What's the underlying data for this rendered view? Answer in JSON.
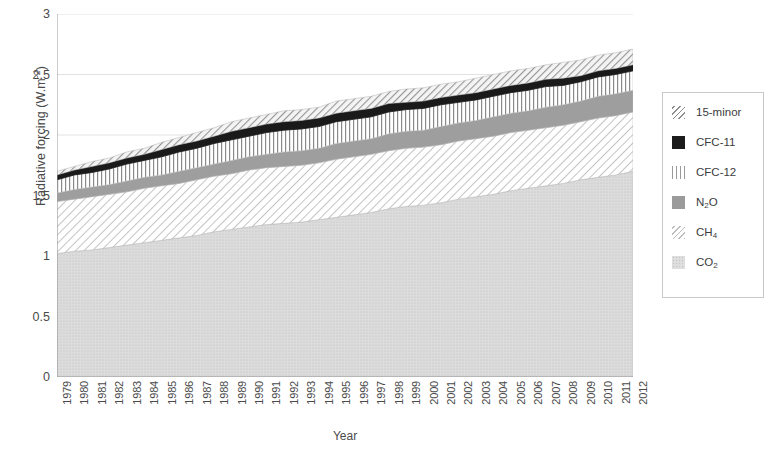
{
  "chart_data": {
    "type": "area",
    "title": "",
    "xlabel": "Year",
    "ylabel": "Radiative forcing (W.m⁻²)",
    "ylabel_html": "Radiative forcing (W.m<sup>-2</sup>)",
    "ylim": [
      0,
      3
    ],
    "ytick_labels": [
      "0",
      "0.5",
      "1",
      "1.5",
      "2",
      "2.5",
      "3"
    ],
    "ytick_values": [
      0,
      0.5,
      1,
      1.5,
      2,
      2.5,
      3
    ],
    "grid": true,
    "legend_position": "right",
    "stacked": true,
    "stack_order_bottom_to_top": [
      "CO2",
      "CH4",
      "N2O",
      "CFC-12",
      "CFC-11",
      "15-minor"
    ],
    "categories": [
      "1979",
      "1980",
      "1981",
      "1982",
      "1983",
      "1984",
      "1985",
      "1986",
      "1987",
      "1988",
      "1989",
      "1990",
      "1991",
      "1992",
      "1993",
      "1994",
      "1995",
      "1996",
      "1997",
      "1998",
      "1999",
      "2000",
      "2001",
      "2002",
      "2003",
      "2004",
      "2005",
      "2006",
      "2007",
      "2008",
      "2009",
      "2010",
      "2011",
      "2012"
    ],
    "series": [
      {
        "name": "CO2",
        "values": [
          1.02,
          1.04,
          1.05,
          1.07,
          1.09,
          1.11,
          1.13,
          1.15,
          1.17,
          1.2,
          1.22,
          1.24,
          1.26,
          1.27,
          1.28,
          1.3,
          1.32,
          1.34,
          1.36,
          1.39,
          1.41,
          1.42,
          1.44,
          1.47,
          1.49,
          1.51,
          1.54,
          1.56,
          1.58,
          1.6,
          1.63,
          1.65,
          1.67,
          1.7
        ]
      },
      {
        "name": "CH4",
        "values": [
          0.43,
          0.43,
          0.44,
          0.44,
          0.44,
          0.45,
          0.45,
          0.45,
          0.46,
          0.46,
          0.46,
          0.47,
          0.47,
          0.47,
          0.47,
          0.47,
          0.48,
          0.48,
          0.48,
          0.48,
          0.48,
          0.48,
          0.48,
          0.48,
          0.48,
          0.48,
          0.48,
          0.48,
          0.48,
          0.48,
          0.48,
          0.49,
          0.49,
          0.49
        ]
      },
      {
        "name": "N2O",
        "values": [
          0.07,
          0.08,
          0.08,
          0.08,
          0.09,
          0.09,
          0.09,
          0.1,
          0.1,
          0.1,
          0.11,
          0.11,
          0.11,
          0.12,
          0.12,
          0.12,
          0.13,
          0.13,
          0.13,
          0.14,
          0.14,
          0.14,
          0.15,
          0.15,
          0.15,
          0.16,
          0.16,
          0.16,
          0.17,
          0.17,
          0.17,
          0.18,
          0.18,
          0.18
        ]
      },
      {
        "name": "CFC-12",
        "values": [
          0.11,
          0.12,
          0.12,
          0.13,
          0.14,
          0.14,
          0.15,
          0.16,
          0.16,
          0.17,
          0.17,
          0.17,
          0.18,
          0.18,
          0.18,
          0.18,
          0.18,
          0.18,
          0.18,
          0.18,
          0.18,
          0.18,
          0.18,
          0.17,
          0.17,
          0.17,
          0.17,
          0.17,
          0.17,
          0.16,
          0.16,
          0.16,
          0.16,
          0.16
        ]
      },
      {
        "name": "CFC-11",
        "values": [
          0.04,
          0.04,
          0.05,
          0.05,
          0.05,
          0.05,
          0.06,
          0.06,
          0.06,
          0.06,
          0.07,
          0.07,
          0.07,
          0.07,
          0.07,
          0.07,
          0.07,
          0.07,
          0.07,
          0.07,
          0.06,
          0.06,
          0.06,
          0.06,
          0.06,
          0.06,
          0.06,
          0.06,
          0.06,
          0.06,
          0.05,
          0.05,
          0.05,
          0.05
        ]
      },
      {
        "name": "15-minor",
        "values": [
          0.03,
          0.03,
          0.04,
          0.04,
          0.05,
          0.05,
          0.06,
          0.06,
          0.07,
          0.07,
          0.08,
          0.08,
          0.08,
          0.09,
          0.09,
          0.09,
          0.1,
          0.1,
          0.1,
          0.1,
          0.11,
          0.11,
          0.11,
          0.11,
          0.12,
          0.12,
          0.12,
          0.12,
          0.12,
          0.13,
          0.13,
          0.13,
          0.13,
          0.13
        ]
      }
    ],
    "totals": [
      1.7,
      1.74,
      1.78,
      1.81,
      1.86,
      1.89,
      1.94,
      1.98,
      2.02,
      2.06,
      2.11,
      2.14,
      2.17,
      2.2,
      2.21,
      2.23,
      2.28,
      2.3,
      2.32,
      2.36,
      2.38,
      2.39,
      2.42,
      2.44,
      2.47,
      2.5,
      2.53,
      2.55,
      2.58,
      2.6,
      2.62,
      2.66,
      2.68,
      2.71
    ]
  },
  "axes": {
    "y_title_text": "Radiative forcing (W.m",
    "y_title_sup": "-2",
    "y_title_tail": ")",
    "x_title": "Year"
  },
  "legend": {
    "items": [
      {
        "label": "15-minor",
        "pattern": "diagonal-hatch-dark",
        "swatch_class": "sw-15minor"
      },
      {
        "label": "CFC-11",
        "pattern": "solid-black",
        "swatch_class": "sw-cfc11"
      },
      {
        "label": "CFC-12",
        "pattern": "vertical-lines",
        "swatch_class": "sw-cfc12"
      },
      {
        "label": "N2O",
        "pattern": "solid-gray",
        "swatch_class": "sw-n2o",
        "base": "N",
        "sub": "2",
        "tail": "O"
      },
      {
        "label": "CH4",
        "pattern": "diagonal-hatch-light",
        "swatch_class": "sw-ch4",
        "base": "CH",
        "sub": "4",
        "tail": ""
      },
      {
        "label": "CO2",
        "pattern": "dotted-light",
        "swatch_class": "sw-co2",
        "base": "CO",
        "sub": "2",
        "tail": ""
      }
    ]
  },
  "colors": {
    "axis": "#8f8f8f",
    "grid": "#e2e2e2",
    "text": "#4a4a4a",
    "co2": "#dedede",
    "ch4": "#f2f2f2",
    "n2o": "#9b9b9b",
    "cfc12": "#ffffff",
    "cfc11": "#1c1c1c",
    "minor15": "#e8e8e8"
  }
}
